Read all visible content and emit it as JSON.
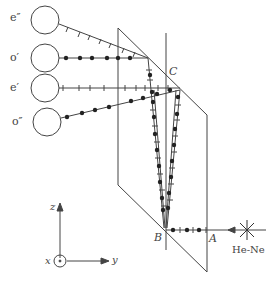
{
  "diagram": {
    "type": "optics-setup",
    "detectors": [
      {
        "id": "e2",
        "label": "e″",
        "polarization": "e",
        "marker": "tick"
      },
      {
        "id": "o1",
        "label": "o′",
        "polarization": "o",
        "marker": "dot"
      },
      {
        "id": "e1",
        "label": "e′",
        "polarization": "e",
        "marker": "tick"
      },
      {
        "id": "o2",
        "label": "o″",
        "polarization": "o",
        "marker": "dot"
      }
    ],
    "points": {
      "A": "A",
      "B": "B",
      "C": "C"
    },
    "source": {
      "label": "He-Ne"
    },
    "axes": {
      "z": "z",
      "y": "y",
      "x": "x"
    },
    "colors": {
      "line": "#444444",
      "dot": "#222222"
    }
  }
}
